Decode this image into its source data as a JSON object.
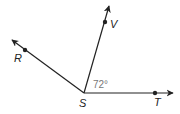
{
  "diagram": {
    "type": "angles",
    "vertex": {
      "label": "S",
      "x": 84,
      "y": 93
    },
    "rays": [
      {
        "name": "ray-SR",
        "label": "R",
        "tip": [
          12,
          40
        ],
        "point": [
          25,
          50
        ],
        "label_pos": [
          14,
          62
        ]
      },
      {
        "name": "ray-SV",
        "label": "V",
        "tip": [
          109,
          6
        ],
        "point": [
          105,
          22
        ],
        "label_pos": [
          110,
          28
        ]
      },
      {
        "name": "ray-ST",
        "label": "T",
        "tip": [
          173,
          93
        ],
        "point": [
          155,
          93
        ],
        "label_pos": [
          154,
          106
        ]
      }
    ],
    "angle_label": {
      "text": "72°",
      "x": 93,
      "y": 88
    },
    "colors": {
      "line": "#222222",
      "angle_text": "#777777"
    }
  }
}
